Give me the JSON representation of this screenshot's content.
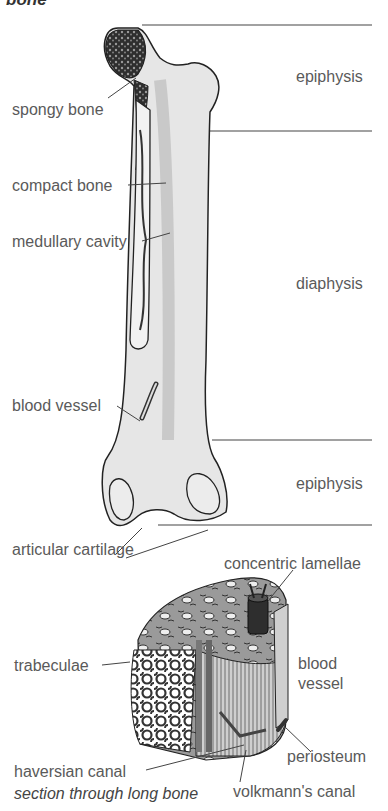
{
  "title": "bone",
  "caption": "section through long bone",
  "regions": [
    {
      "label": "epiphysis",
      "position": "top"
    },
    {
      "label": "diaphysis",
      "position": "middle"
    },
    {
      "label": "epiphysis",
      "position": "bottom"
    }
  ],
  "bone_labels": {
    "spongy_bone": "spongy bone",
    "compact_bone": "compact bone",
    "medullary_cavity": "medullary cavity",
    "blood_vessel": "blood vessel",
    "articular_cartilage": "articular cartilage"
  },
  "section_labels": {
    "concentric_lamellae": "concentric lamellae",
    "trabeculae": "trabeculae",
    "blood_vessel_line1": "blood",
    "blood_vessel_line2": "vessel",
    "periosteum": "periosteum",
    "haversian_canal": "haversian canal",
    "volkmanns_canal": "volkmann's canal"
  },
  "colors": {
    "line": "#333333",
    "bone_fill": "#e4e4e4",
    "bone_shade": "#c8c8c8",
    "spongy": "#3a3a3a",
    "text": "#5a5a5a"
  }
}
